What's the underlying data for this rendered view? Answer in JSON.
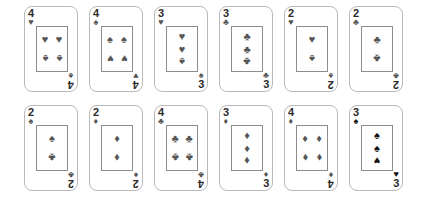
{
  "scene": {
    "title": "playing-card-grid",
    "background_color": "#ffffff",
    "card_border_color": "#b9b9b9",
    "pip_box_border_color": "#8d8d8d",
    "pip_color": "#555555",
    "rank_color": "#2b2b2b",
    "rows": 2,
    "columns": 6,
    "card_count": 12
  },
  "glyphs": {
    "heart": "♥",
    "spade": "♠",
    "club": "♣",
    "diamond": "♦"
  },
  "cards": [
    {
      "id": "card-1",
      "rank": "4",
      "corner_top_left_suit": "heart",
      "corner_bottom_right_suit": "spade",
      "corner_bottom_right_rank": "4",
      "corner_bottom_right_rotated": true,
      "columns": 2,
      "pips": [
        {
          "suit": "heart",
          "flipped": false
        },
        {
          "suit": "heart",
          "flipped": false
        },
        {
          "suit": "spade",
          "flipped": true
        },
        {
          "suit": "spade",
          "flipped": true
        }
      ]
    },
    {
      "id": "card-2",
      "rank": "4",
      "corner_top_left_suit": "spade",
      "corner_bottom_right_suit": "heart",
      "corner_bottom_right_rank": "4",
      "corner_bottom_right_rotated": true,
      "columns": 2,
      "pips": [
        {
          "suit": "spade",
          "flipped": false
        },
        {
          "suit": "spade",
          "flipped": false
        },
        {
          "suit": "heart",
          "flipped": true
        },
        {
          "suit": "heart",
          "flipped": true
        }
      ]
    },
    {
      "id": "card-3",
      "rank": "3",
      "corner_top_left_suit": "heart",
      "corner_bottom_right_suit": "spade",
      "corner_bottom_right_rank": "3",
      "corner_bottom_right_rotated": false,
      "columns": 1,
      "pips": [
        {
          "suit": "heart",
          "flipped": false
        },
        {
          "suit": "heart",
          "flipped": false
        },
        {
          "suit": "spade",
          "flipped": true
        }
      ]
    },
    {
      "id": "card-4",
      "rank": "3",
      "corner_top_left_suit": "club",
      "corner_bottom_right_suit": "club",
      "corner_bottom_right_rank": "3",
      "corner_bottom_right_rotated": false,
      "columns": 1,
      "pips": [
        {
          "suit": "club",
          "flipped": false
        },
        {
          "suit": "club",
          "flipped": false
        },
        {
          "suit": "club",
          "flipped": true
        }
      ]
    },
    {
      "id": "card-5",
      "rank": "2",
      "corner_top_left_suit": "heart",
      "corner_bottom_right_suit": "spade",
      "corner_bottom_right_rank": "2",
      "corner_bottom_right_rotated": true,
      "columns": 1,
      "pips": [
        {
          "suit": "heart",
          "flipped": false
        },
        {
          "suit": "spade",
          "flipped": true
        }
      ]
    },
    {
      "id": "card-6",
      "rank": "2",
      "corner_top_left_suit": "club",
      "corner_bottom_right_suit": "club",
      "corner_bottom_right_rank": "2",
      "corner_bottom_right_rotated": true,
      "columns": 1,
      "pips": [
        {
          "suit": "club",
          "flipped": false
        },
        {
          "suit": "club",
          "flipped": true
        }
      ]
    },
    {
      "id": "card-7",
      "rank": "2",
      "corner_top_left_suit": "spade",
      "corner_bottom_right_suit": "club",
      "corner_bottom_right_rank": "2",
      "corner_bottom_right_rotated": true,
      "columns": 1,
      "pips": [
        {
          "suit": "spade",
          "flipped": false
        },
        {
          "suit": "club",
          "flipped": true
        }
      ]
    },
    {
      "id": "card-8",
      "rank": "2",
      "corner_top_left_suit": "diamond",
      "corner_bottom_right_suit": "diamond",
      "corner_bottom_right_rank": "2",
      "corner_bottom_right_rotated": true,
      "columns": 1,
      "pips": [
        {
          "suit": "diamond",
          "flipped": false
        },
        {
          "suit": "diamond",
          "flipped": true
        }
      ]
    },
    {
      "id": "card-9",
      "rank": "4",
      "corner_top_left_suit": "club",
      "corner_bottom_right_suit": "club",
      "corner_bottom_right_rank": "4",
      "corner_bottom_right_rotated": true,
      "columns": 2,
      "pips": [
        {
          "suit": "club",
          "flipped": false
        },
        {
          "suit": "club",
          "flipped": false
        },
        {
          "suit": "club",
          "flipped": true
        },
        {
          "suit": "club",
          "flipped": true
        }
      ]
    },
    {
      "id": "card-10",
      "rank": "3",
      "corner_top_left_suit": "diamond",
      "corner_bottom_right_suit": "diamond",
      "corner_bottom_right_rank": "3",
      "corner_bottom_right_rotated": false,
      "columns": 1,
      "pips": [
        {
          "suit": "diamond",
          "flipped": false
        },
        {
          "suit": "diamond",
          "flipped": false
        },
        {
          "suit": "diamond",
          "flipped": true
        }
      ]
    },
    {
      "id": "card-11",
      "rank": "4",
      "corner_top_left_suit": "diamond",
      "corner_bottom_right_suit": "diamond",
      "corner_bottom_right_rank": "4",
      "corner_bottom_right_rotated": true,
      "columns": 2,
      "pips": [
        {
          "suit": "diamond",
          "flipped": false
        },
        {
          "suit": "diamond",
          "flipped": false
        },
        {
          "suit": "diamond",
          "flipped": true
        },
        {
          "suit": "diamond",
          "flipped": true
        }
      ]
    },
    {
      "id": "card-12",
      "rank": "3",
      "corner_top_left_suit": "spade",
      "corner_bottom_right_suit": "heart",
      "corner_bottom_right_rank": "3",
      "corner_bottom_right_rotated": false,
      "columns": 1,
      "dark": true,
      "pips": [
        {
          "suit": "spade",
          "flipped": false
        },
        {
          "suit": "spade",
          "flipped": false
        },
        {
          "suit": "heart",
          "flipped": true
        }
      ]
    }
  ]
}
